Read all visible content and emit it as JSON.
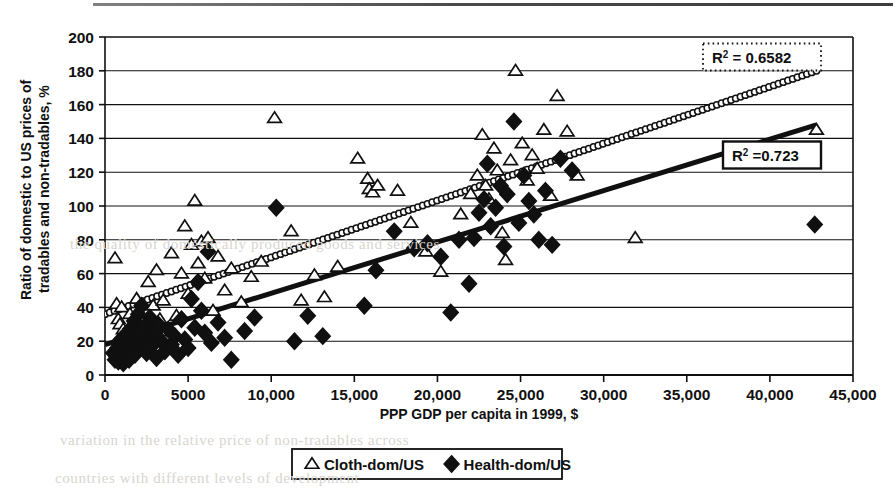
{
  "figure": {
    "background_color": "#ffffff",
    "ink_color": "#101010",
    "page_rule": true
  },
  "bleed_text": {
    "line1": "the quality of domestically produced goods and services",
    "line2": "variation in the relative price of non-tradables across",
    "line3": "countries with different levels of development"
  },
  "axes": {
    "x": {
      "label": "PPP GDP per capita in 1999, $",
      "min": 0,
      "max": 45000,
      "tick_step": 5000,
      "ticks": [
        "0",
        "5000",
        "10,000",
        "15,000",
        "20,000",
        "25,000",
        "30,000",
        "35,000",
        "40,000",
        "45,000"
      ]
    },
    "y": {
      "label_line1": "Ratio of domestic to US prices of",
      "label_line2": "tradables and non-tradables, %",
      "min": 0,
      "max": 200,
      "tick_step": 20,
      "ticks": [
        "0",
        "20",
        "40",
        "60",
        "80",
        "100",
        "120",
        "140",
        "160",
        "180",
        "200"
      ]
    }
  },
  "legend": {
    "position": "bottom-center",
    "bordered": true,
    "items": [
      {
        "marker": "triangle-open",
        "label": "Cloth-dom/US"
      },
      {
        "marker": "diamond-filled",
        "label": "Health-dom/US"
      }
    ]
  },
  "annotations": [
    {
      "id": "r2-cloth",
      "prefix": "R",
      "superscript": "2",
      "text": " = 0.6582",
      "value": 0.6582,
      "border_style": "dotted",
      "x_px": 762,
      "y_px": 57
    },
    {
      "id": "r2-health",
      "prefix": "R",
      "superscript": "2",
      "text": " =0.723",
      "value": 0.723,
      "border_style": "solid",
      "x_px": 772,
      "y_px": 155
    }
  ],
  "chart_data": {
    "type": "scatter",
    "title": "",
    "xlabel": "PPP GDP per capita in 1999, $",
    "ylabel": "Ratio of domestic to US prices of tradables and non-tradables, %",
    "xlim": [
      0,
      45000
    ],
    "ylim": [
      0,
      200
    ],
    "xtick_step": 5000,
    "ytick_step": 20,
    "grid": "horizontal",
    "legend_position": "bottom-center",
    "series": [
      {
        "name": "Cloth-dom/US",
        "marker": "triangle-open",
        "color": "#101010",
        "points": [
          [
            600,
            69
          ],
          [
            700,
            42
          ],
          [
            800,
            33
          ],
          [
            900,
            30
          ],
          [
            1000,
            40
          ],
          [
            1100,
            27
          ],
          [
            1300,
            24
          ],
          [
            1500,
            36
          ],
          [
            1700,
            31
          ],
          [
            1900,
            45
          ],
          [
            2100,
            28
          ],
          [
            2300,
            22
          ],
          [
            2600,
            55
          ],
          [
            2900,
            41
          ],
          [
            3100,
            62
          ],
          [
            3300,
            33
          ],
          [
            3500,
            44
          ],
          [
            3700,
            26
          ],
          [
            4000,
            72
          ],
          [
            4300,
            35
          ],
          [
            4600,
            60
          ],
          [
            4800,
            88
          ],
          [
            5000,
            48
          ],
          [
            5200,
            77
          ],
          [
            5400,
            103
          ],
          [
            5600,
            66
          ],
          [
            5800,
            79
          ],
          [
            6000,
            57
          ],
          [
            6200,
            81
          ],
          [
            6500,
            38
          ],
          [
            6800,
            70
          ],
          [
            7200,
            50
          ],
          [
            7600,
            63
          ],
          [
            8200,
            43
          ],
          [
            8800,
            58
          ],
          [
            9400,
            67
          ],
          [
            10200,
            152
          ],
          [
            11200,
            85
          ],
          [
            11800,
            44
          ],
          [
            12600,
            59
          ],
          [
            13200,
            46
          ],
          [
            14000,
            64
          ],
          [
            15200,
            128
          ],
          [
            15800,
            116
          ],
          [
            15900,
            110
          ],
          [
            16100,
            108
          ],
          [
            16400,
            112
          ],
          [
            17600,
            109
          ],
          [
            18400,
            90
          ],
          [
            19300,
            73
          ],
          [
            20200,
            61
          ],
          [
            21400,
            95
          ],
          [
            22000,
            107
          ],
          [
            22400,
            118
          ],
          [
            22700,
            142
          ],
          [
            22900,
            112
          ],
          [
            23100,
            104
          ],
          [
            23400,
            134
          ],
          [
            23600,
            121
          ],
          [
            23900,
            84
          ],
          [
            24100,
            68
          ],
          [
            24400,
            127
          ],
          [
            24700,
            180
          ],
          [
            25100,
            137
          ],
          [
            25400,
            115
          ],
          [
            25700,
            130
          ],
          [
            26000,
            122
          ],
          [
            26400,
            145
          ],
          [
            26800,
            106
          ],
          [
            27200,
            165
          ],
          [
            27800,
            144
          ],
          [
            28400,
            118
          ],
          [
            31900,
            81
          ],
          [
            42800,
            145
          ]
        ]
      },
      {
        "name": "Health-dom/US",
        "marker": "diamond-filled",
        "color": "#101010",
        "points": [
          [
            500,
            13
          ],
          [
            600,
            9
          ],
          [
            700,
            11
          ],
          [
            750,
            16
          ],
          [
            800,
            8
          ],
          [
            850,
            14
          ],
          [
            900,
            10
          ],
          [
            950,
            21
          ],
          [
            1000,
            12
          ],
          [
            1050,
            17
          ],
          [
            1100,
            7
          ],
          [
            1150,
            19
          ],
          [
            1200,
            15
          ],
          [
            1250,
            24
          ],
          [
            1300,
            11
          ],
          [
            1400,
            18
          ],
          [
            1450,
            9
          ],
          [
            1500,
            27
          ],
          [
            1600,
            14
          ],
          [
            1700,
            22
          ],
          [
            1750,
            32
          ],
          [
            1800,
            12
          ],
          [
            1900,
            26
          ],
          [
            2000,
            36
          ],
          [
            2100,
            16
          ],
          [
            2200,
            41
          ],
          [
            2300,
            19
          ],
          [
            2400,
            29
          ],
          [
            2500,
            13
          ],
          [
            2600,
            23
          ],
          [
            2700,
            34
          ],
          [
            2800,
            17
          ],
          [
            3000,
            25
          ],
          [
            3100,
            10
          ],
          [
            3200,
            30
          ],
          [
            3400,
            20
          ],
          [
            3600,
            14
          ],
          [
            3800,
            27
          ],
          [
            4000,
            18
          ],
          [
            4200,
            23
          ],
          [
            4400,
            12
          ],
          [
            4600,
            33
          ],
          [
            4800,
            21
          ],
          [
            5000,
            16
          ],
          [
            5200,
            45
          ],
          [
            5400,
            28
          ],
          [
            5600,
            55
          ],
          [
            5800,
            38
          ],
          [
            6000,
            25
          ],
          [
            6200,
            73
          ],
          [
            6400,
            19
          ],
          [
            6800,
            31
          ],
          [
            7200,
            22
          ],
          [
            7600,
            9
          ],
          [
            8400,
            26
          ],
          [
            9000,
            34
          ],
          [
            10300,
            99
          ],
          [
            11400,
            20
          ],
          [
            12200,
            35
          ],
          [
            13100,
            23
          ],
          [
            15600,
            41
          ],
          [
            16300,
            62
          ],
          [
            17400,
            85
          ],
          [
            18600,
            75
          ],
          [
            19400,
            78
          ],
          [
            20200,
            70
          ],
          [
            20800,
            37
          ],
          [
            21300,
            80
          ],
          [
            21900,
            54
          ],
          [
            22200,
            81
          ],
          [
            22500,
            96
          ],
          [
            22800,
            104
          ],
          [
            23000,
            125
          ],
          [
            23200,
            88
          ],
          [
            23500,
            99
          ],
          [
            23800,
            112
          ],
          [
            24000,
            76
          ],
          [
            24200,
            107
          ],
          [
            24600,
            150
          ],
          [
            24900,
            90
          ],
          [
            25200,
            118
          ],
          [
            25500,
            103
          ],
          [
            25800,
            95
          ],
          [
            26100,
            80
          ],
          [
            26500,
            109
          ],
          [
            26900,
            77
          ],
          [
            27400,
            128
          ],
          [
            28100,
            121
          ],
          [
            42700,
            89
          ]
        ]
      }
    ],
    "trendlines": [
      {
        "name": "Cloth-dom/US trend",
        "style": "dotted-thick",
        "x_start": 0,
        "y_start": 36,
        "x_end": 42800,
        "y_end": 180,
        "r_squared": 0.6582
      },
      {
        "name": "Health-dom/US trend",
        "style": "solid-thick",
        "x_start": 0,
        "y_start": 18,
        "x_end": 42800,
        "y_end": 148,
        "r_squared": 0.723
      }
    ]
  }
}
